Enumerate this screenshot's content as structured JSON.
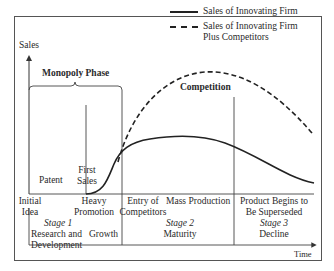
{
  "diagram": {
    "type": "product-life-cycle",
    "axis": {
      "y_label": "Sales",
      "x_label": "Time"
    },
    "legend": [
      {
        "style": "solid",
        "label": "Sales of Innovating Firm"
      },
      {
        "style": "dashed",
        "label_line1": "Sales of Innovating Firm",
        "label_line2": "Plus Competitors"
      }
    ],
    "phases": {
      "monopoly": "Monopoly Phase",
      "competition": "Competition"
    },
    "upper_labels": {
      "patent": "Patent",
      "first_sales_line1": "First",
      "first_sales_line2": "Sales"
    },
    "events": [
      {
        "line1": "Initial",
        "line2": "Idea"
      },
      {
        "line1": "Heavy",
        "line2": "Promotion"
      },
      {
        "line1": "Entry of",
        "line2": "Competitors"
      },
      {
        "line1": "Mass Production",
        "line2": ""
      },
      {
        "line1": "Product Begins to",
        "line2": "Be Superseded"
      }
    ],
    "stages": [
      {
        "title": "Stage 1",
        "line1": "Research and",
        "line2": "Development"
      },
      {
        "title": "",
        "line1": "Growth",
        "line2": ""
      },
      {
        "title": "Stage 2",
        "line1": "Maturity",
        "line2": ""
      },
      {
        "title": "Stage 3",
        "line1": "Decline",
        "line2": ""
      }
    ],
    "colors": {
      "line": "#222222",
      "frame": "#555555",
      "background": "#ffffff"
    }
  }
}
